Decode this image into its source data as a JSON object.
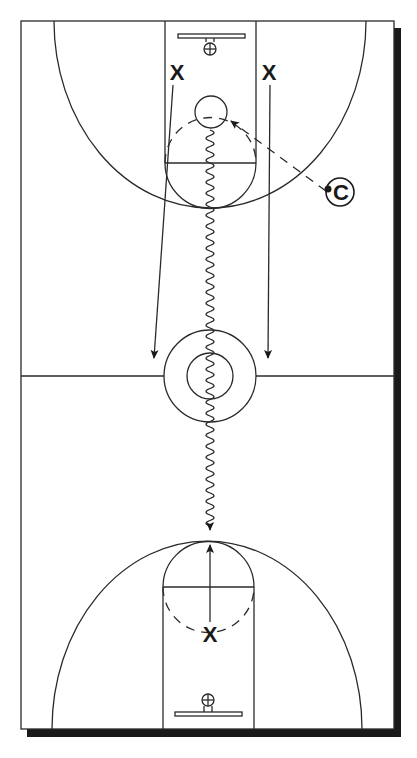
{
  "diagram": {
    "colors": {
      "line": "#2a2a2a",
      "shadow": "#1a1a1a",
      "background": "#ffffff"
    },
    "players": [
      {
        "id": "x-top-left",
        "label": "X",
        "role": "offense"
      },
      {
        "id": "x-top-right",
        "label": "X",
        "role": "offense"
      },
      {
        "id": "x-bottom",
        "label": "X",
        "role": "offense"
      }
    ],
    "coach": {
      "label": "C",
      "role": "coach"
    },
    "movements": [
      {
        "type": "cut",
        "from": "x-top-left",
        "to": "half-court-left"
      },
      {
        "type": "cut",
        "from": "x-top-right",
        "to": "half-court-right"
      },
      {
        "type": "dribble",
        "from": "ball-top",
        "to": "top-of-key-bottom"
      },
      {
        "type": "pass",
        "from": "coach",
        "to": "ball-top"
      },
      {
        "type": "cut",
        "from": "x-bottom",
        "to": "top-of-key-bottom"
      }
    ],
    "legend": {
      "solid_arrow": "cut",
      "wavy_arrow": "dribble",
      "dashed_arrow": "pass"
    }
  }
}
